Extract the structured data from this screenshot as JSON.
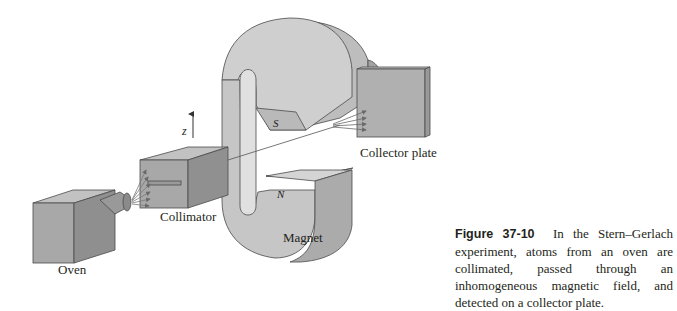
{
  "figure": {
    "number": "Figure 37-10",
    "caption": "In the Stern–Gerlach experiment, atoms from an oven are collimated, passed through an inhomogeneous magnetic field, and detected on a collector plate.",
    "labels": {
      "oven": "Oven",
      "collimator": "Collimator",
      "magnet": "Magnet",
      "collector": "Collector plate",
      "south_pole": "S",
      "north_pole": "N",
      "axis": "z"
    }
  },
  "colors": {
    "face_front": "#a8a8a8",
    "face_side": "#8f8f8f",
    "face_top": "#c2c2c2",
    "magnet_light": "#cfcfcf",
    "magnet_mid": "#b5b5b5",
    "outline": "#4a4a4a"
  }
}
